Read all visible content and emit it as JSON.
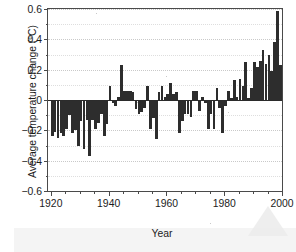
{
  "chart_data": {
    "type": "bar",
    "title": "",
    "xlabel": "Year",
    "ylabel": "Average temperature change (°C)",
    "xlim": [
      1919,
      2000
    ],
    "ylim": [
      -0.6,
      0.6
    ],
    "grid": true,
    "legend": "none",
    "ytick_labels": [
      "0.6",
      "0.4",
      "0.2",
      "0",
      "−0.2",
      "−0.4",
      "−0.6"
    ],
    "ytick_values": [
      0.6,
      0.4,
      0.2,
      0,
      -0.2,
      -0.4,
      -0.6
    ],
    "yminor_values": [
      0.5,
      0.3,
      0.1,
      -0.1,
      -0.3,
      -0.5
    ],
    "xtick_labels": [
      "1920",
      "1940",
      "1960",
      "1980",
      "2000"
    ],
    "xtick_values": [
      1920,
      1940,
      1960,
      1980,
      2000
    ],
    "xminor_values": [
      1925,
      1930,
      1935,
      1945,
      1950,
      1955,
      1965,
      1970,
      1975,
      1985,
      1990,
      1995
    ],
    "bar_color": "#2d2d2d",
    "categories": [
      1920,
      1921,
      1922,
      1923,
      1924,
      1925,
      1926,
      1927,
      1928,
      1929,
      1930,
      1931,
      1932,
      1933,
      1934,
      1935,
      1936,
      1937,
      1938,
      1939,
      1940,
      1941,
      1942,
      1943,
      1944,
      1945,
      1946,
      1947,
      1948,
      1949,
      1950,
      1951,
      1952,
      1953,
      1954,
      1955,
      1956,
      1957,
      1958,
      1959,
      1960,
      1961,
      1962,
      1963,
      1964,
      1965,
      1966,
      1967,
      1968,
      1969,
      1970,
      1971,
      1972,
      1973,
      1974,
      1975,
      1976,
      1977,
      1978,
      1979,
      1980,
      1981,
      1982,
      1983,
      1984,
      1985,
      1986,
      1987,
      1988,
      1989,
      1990,
      1991,
      1992,
      1993,
      1994,
      1995,
      1996,
      1997,
      1998,
      1999
    ],
    "values": [
      -0.24,
      -0.21,
      -0.25,
      -0.22,
      -0.24,
      -0.19,
      -0.1,
      -0.22,
      -0.2,
      -0.3,
      -0.14,
      -0.32,
      -0.13,
      -0.37,
      -0.13,
      -0.19,
      -0.15,
      -0.09,
      -0.24,
      -0.16,
      0.09,
      -0.02,
      -0.04,
      0.02,
      0.23,
      0.06,
      0.06,
      0.06,
      0.05,
      -0.06,
      -0.09,
      -0.08,
      -0.05,
      0.09,
      -0.19,
      -0.12,
      -0.26,
      0.05,
      0.09,
      0.02,
      0.04,
      0.11,
      0.04,
      0.05,
      -0.22,
      -0.14,
      -0.09,
      -0.09,
      -0.11,
      0.06,
      0.06,
      -0.07,
      0.02,
      -0.02,
      -0.19,
      -0.09,
      -0.19,
      0.08,
      -0.05,
      -0.22,
      -0.04,
      0.06,
      0.01,
      0.13,
      0.02,
      0.14,
      0.09,
      0.25,
      0.01,
      0.08,
      0.25,
      0.22,
      0.26,
      0.33,
      0.24,
      0.3,
      0.19,
      0.38,
      0.59,
      0.23
    ]
  }
}
